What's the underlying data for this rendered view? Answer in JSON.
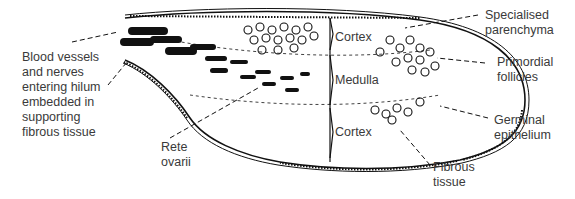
{
  "figure": {
    "labels": {
      "blood_vessels": "Blood vessels\nand nerves\nentering hilum\nembedded in\nsupporting\nfibrous tissue",
      "rete_ovarii": "Rete\novarii",
      "specialised_parenchyma": "Specialised\nparenchyma",
      "primordial_follicles": "Primordial\nfollicles",
      "germinal_epithelium": "Germinal\nepithelium",
      "fibrous_tissue": "Fibrous\ntissue",
      "cortex_top": "Cortex",
      "medulla": "Medulla",
      "cortex_bottom": "Cortex"
    },
    "colors": {
      "ink": "#111111",
      "text": "#3a3a3a",
      "background": "#ffffff"
    }
  }
}
